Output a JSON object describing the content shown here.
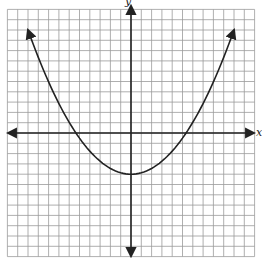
{
  "chart_data": {
    "type": "line",
    "title": "",
    "xlabel": "x",
    "ylabel": "y",
    "grid": true,
    "xlim": [
      -12,
      12
    ],
    "ylim": [
      -12,
      12
    ],
    "grid_step": 1,
    "series": [
      {
        "name": "parabola",
        "equation": "y = 0.16x^2 - 4",
        "vertex": [
          0,
          -4
        ],
        "x_intercepts": [
          -5,
          5
        ],
        "points": [
          [
            -10,
            10
          ],
          [
            -5,
            0
          ],
          [
            0,
            -4
          ],
          [
            5,
            0
          ],
          [
            10,
            10
          ]
        ],
        "arrows_at_ends": true
      }
    ]
  },
  "labels": {
    "x_axis": "x",
    "y_axis": "y"
  }
}
